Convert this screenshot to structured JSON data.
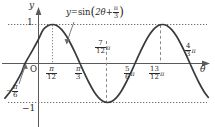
{
  "figure": {
    "kind": "trigonometric-graph",
    "axes": {
      "y_axis_label": "y",
      "x_axis_label": "θ",
      "origin_label": "O",
      "y_tick_top": "1",
      "y_tick_bottom": "−1"
    },
    "equation": {
      "lhs": "y",
      "equals": "=",
      "func": "sin",
      "open_paren": "(",
      "arg_first": "2θ",
      "arg_plus": "+",
      "arg_frac_num": "π",
      "arg_frac_den": "3",
      "close_paren": ")"
    },
    "x_labels": [
      {
        "name": "neg-pi-over-6",
        "sign": "−",
        "num": "π",
        "den": "6",
        "suffix": ""
      },
      {
        "name": "pi-over-12",
        "sign": "",
        "num": "π",
        "den": "12",
        "suffix": ""
      },
      {
        "name": "pi-over-3",
        "sign": "",
        "num": "π",
        "den": "3",
        "suffix": ""
      },
      {
        "name": "seven-twelfths-pi",
        "sign": "",
        "num": "7",
        "den": "12",
        "suffix": "π"
      },
      {
        "name": "five-sixths-pi",
        "sign": "",
        "num": "5",
        "den": "6",
        "suffix": "π"
      },
      {
        "name": "thirteen-twelfths-pi",
        "sign": "",
        "num": "13",
        "den": "12",
        "suffix": "π"
      },
      {
        "name": "four-thirds-pi",
        "sign": "",
        "num": "4",
        "den": "3",
        "suffix": "π"
      }
    ]
  },
  "chart_data": {
    "type": "line",
    "title": "",
    "subtitle": "",
    "xlabel": "θ",
    "ylabel": "y",
    "function": "y = sin(2θ + π/3)",
    "amplitude": 1,
    "period_in_pi": 1,
    "phase_shift_in_pi": -0.16666666,
    "xlim_in_pi": [
      -0.3333,
      1.5
    ],
    "ylim": [
      -1.35,
      1.35
    ],
    "grid": false,
    "dotted_gridlines_y": [
      1,
      -1
    ],
    "legend": "none",
    "annotations": [
      {
        "text": "y=sin(2θ+π/3)",
        "points_to_x_in_pi": 0.28,
        "points_to_y": 0.72
      },
      {
        "text": "−π/6",
        "points_to_x_in_pi": -0.16666666,
        "points_to_y": 0
      }
    ],
    "x_tick_values_in_pi": [
      -0.16666666,
      0.08333333,
      0.33333333,
      0.58333333,
      0.83333333,
      1.08333333,
      1.33333333
    ],
    "x_tick_labels": [
      "−π/6",
      "π/12",
      "π/3",
      "7π/12",
      "5π/6",
      "13π/12",
      "4π/3"
    ],
    "y_tick_values": [
      1,
      -1
    ],
    "y_tick_labels": [
      "1",
      "−1"
    ],
    "key_points": [
      {
        "label": "x-intercept-rising",
        "x_in_pi": -0.16666666,
        "y": 0
      },
      {
        "label": "maximum",
        "x_in_pi": 0.08333333,
        "y": 1
      },
      {
        "label": "x-intercept-falling",
        "x_in_pi": 0.33333333,
        "y": 0
      },
      {
        "label": "minimum",
        "x_in_pi": 0.58333333,
        "y": -1
      },
      {
        "label": "x-intercept-rising",
        "x_in_pi": 0.83333333,
        "y": 0
      },
      {
        "label": "maximum",
        "x_in_pi": 1.08333333,
        "y": 1
      },
      {
        "label": "x-intercept-falling",
        "x_in_pi": 1.33333333,
        "y": 0
      }
    ],
    "series": [
      {
        "name": "sin(2θ + π/3)",
        "color": "#3a3a3a",
        "x_in_pi": [
          -0.35,
          -0.3,
          -0.25,
          -0.2,
          -0.16667,
          -0.1,
          -0.05,
          0.0,
          0.04167,
          0.08333,
          0.125,
          0.16667,
          0.20833,
          0.25,
          0.29167,
          0.33333,
          0.375,
          0.41667,
          0.45833,
          0.5,
          0.54167,
          0.58333,
          0.625,
          0.66667,
          0.70833,
          0.75,
          0.79167,
          0.83333,
          0.875,
          0.91667,
          0.95833,
          1.0,
          1.04167,
          1.08333,
          1.125,
          1.16667,
          1.20833,
          1.25,
          1.29167,
          1.33333,
          1.375,
          1.41667,
          1.45833,
          1.5
        ],
        "y": [
          -0.89,
          -0.72,
          -0.5,
          -0.24,
          0.0,
          0.33,
          0.59,
          0.87,
          0.97,
          1.0,
          0.97,
          0.87,
          0.71,
          0.5,
          0.26,
          0.0,
          -0.26,
          -0.5,
          -0.71,
          -0.87,
          -0.97,
          -1.0,
          -0.97,
          -0.87,
          -0.71,
          -0.5,
          -0.26,
          0.0,
          0.26,
          0.5,
          0.71,
          0.87,
          0.97,
          1.0,
          0.97,
          0.87,
          0.71,
          0.5,
          0.26,
          0.0,
          -0.26,
          -0.5,
          -0.71,
          -0.87
        ]
      }
    ]
  }
}
